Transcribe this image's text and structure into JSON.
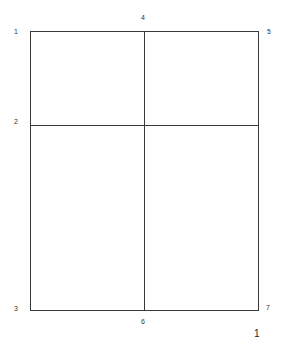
{
  "diagram": {
    "corner_labels": {
      "top_left": "1",
      "left_middle": "2",
      "bottom_left": "3",
      "top_middle": "4",
      "top_right": "5",
      "bottom_middle": "6",
      "bottom_right": "7"
    },
    "page_number": "1",
    "line_color": "#3a3a3a"
  }
}
